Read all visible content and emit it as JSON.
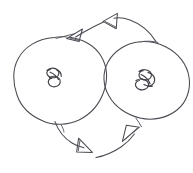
{
  "figure": {
    "kind": "hand-drawn-diagram",
    "title": "Two circular nodes joined by a pair of curved arrows",
    "background_color": "#ffffff",
    "ink_color": "#4a4a52",
    "width": 193,
    "height": 173
  },
  "nodes": [
    {
      "id": "left-node",
      "label": "",
      "shape": "circle",
      "center_x": 62,
      "center_y": 80,
      "radius_x": 47,
      "radius_y": 43,
      "inner_mark": "scribble",
      "inner_mark_x": 53,
      "inner_mark_y": 78
    },
    {
      "id": "right-node",
      "label": "",
      "shape": "circle",
      "center_x": 148,
      "center_y": 82,
      "radius_x": 43,
      "radius_y": 41,
      "inner_mark": "scribble",
      "inner_mark_x": 143,
      "inner_mark_y": 80
    }
  ],
  "edges": [
    {
      "id": "top-edge",
      "from": "right-node",
      "to": "left-node",
      "direction": "right-to-left",
      "curve": "arc-above",
      "arrowheads": [
        {
          "id": "top-left-arrowhead",
          "x": 73,
          "y": 31,
          "points": "down-left",
          "style": "open-triangle"
        },
        {
          "id": "top-right-arrowhead",
          "x": 110,
          "y": 19,
          "points": "left",
          "style": "open-triangle"
        }
      ]
    },
    {
      "id": "bottom-edge",
      "from": "left-node",
      "to": "right-node",
      "direction": "left-to-right",
      "curve": "arc-below",
      "arrowheads": [
        {
          "id": "bottom-left-arrowhead",
          "x": 84,
          "y": 148,
          "points": "down-right",
          "style": "open-triangle"
        },
        {
          "id": "bottom-right-arrowhead",
          "x": 137,
          "y": 127,
          "points": "up-right",
          "style": "open-triangle"
        }
      ]
    }
  ],
  "annotations": {
    "text_labels": [],
    "legend": null,
    "caption": null
  }
}
